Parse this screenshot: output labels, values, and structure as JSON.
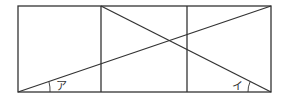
{
  "diagram": {
    "colors": {
      "stroke": "#333333",
      "background": "#ffffff"
    },
    "angles": [
      {
        "id": "a",
        "label": "ア",
        "position": "bottom-left"
      },
      {
        "id": "i",
        "label": "イ",
        "position": "bottom-right"
      }
    ]
  }
}
